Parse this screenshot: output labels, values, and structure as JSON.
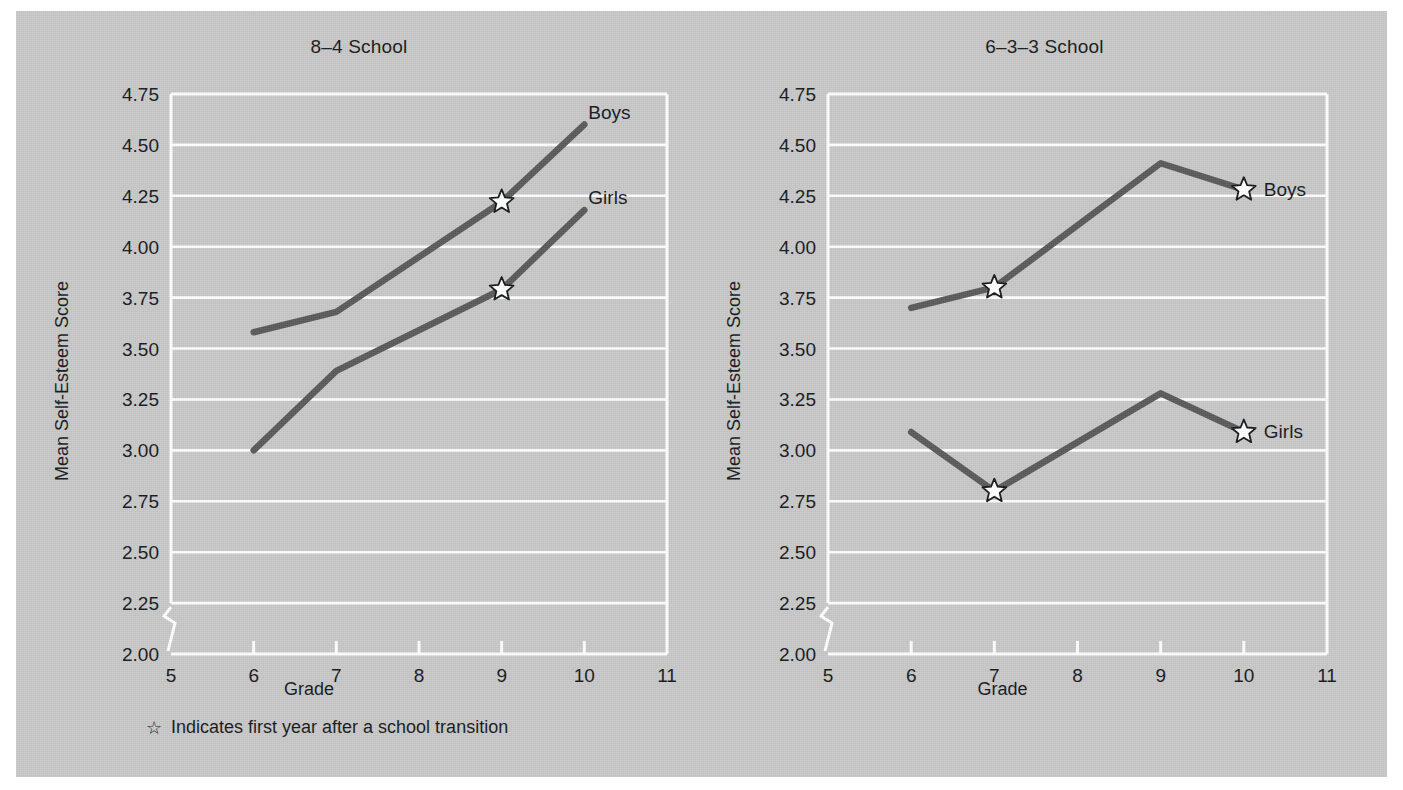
{
  "figure": {
    "background_color": "#c9c9c9",
    "page_color": "#ffffff",
    "line_color": "#5a5a5a",
    "grid_color": "#ffffff",
    "text_color": "#15181a",
    "star_glyph": "☆",
    "footnote": "Indicates first year after a school transition"
  },
  "chart_data": [
    {
      "type": "line",
      "title": "8–4 School",
      "xlabel": "Grade",
      "ylabel": "Mean Self-Esteem Score",
      "xlim": [
        5,
        11
      ],
      "ylim": [
        2.0,
        4.75
      ],
      "xticks": [
        "5",
        "6",
        "7",
        "8",
        "9",
        "10",
        "11"
      ],
      "yticks": [
        "2.00",
        "2.25",
        "2.50",
        "2.75",
        "3.00",
        "3.25",
        "3.50",
        "3.75",
        "4.00",
        "4.25",
        "4.50",
        "4.75"
      ],
      "grid": "horizontal",
      "axis_break": "y-axis break between 2.00 and 2.25",
      "legend_position": "inline at line ends",
      "series": [
        {
          "name": "Boys",
          "x": [
            6,
            7,
            9,
            10
          ],
          "values": [
            3.58,
            3.68,
            4.22,
            4.6
          ],
          "transition_markers": [
            9
          ]
        },
        {
          "name": "Girls",
          "x": [
            6,
            7,
            9,
            10
          ],
          "values": [
            3.0,
            3.39,
            3.79,
            4.18
          ],
          "transition_markers": [
            9
          ]
        }
      ]
    },
    {
      "type": "line",
      "title": "6–3–3 School",
      "xlabel": "Grade",
      "ylabel": "Mean Self-Esteem Score",
      "xlim": [
        5,
        11
      ],
      "ylim": [
        2.0,
        4.75
      ],
      "xticks": [
        "5",
        "6",
        "7",
        "8",
        "9",
        "10",
        "11"
      ],
      "yticks": [
        "2.00",
        "2.25",
        "2.50",
        "2.75",
        "3.00",
        "3.25",
        "3.50",
        "3.75",
        "4.00",
        "4.25",
        "4.50",
        "4.75"
      ],
      "grid": "horizontal",
      "axis_break": "y-axis break between 2.00 and 2.25",
      "legend_position": "inline at line ends",
      "series": [
        {
          "name": "Boys",
          "x": [
            6,
            7,
            9,
            10
          ],
          "values": [
            3.7,
            3.8,
            4.41,
            4.28
          ],
          "transition_markers": [
            7,
            10
          ]
        },
        {
          "name": "Girls",
          "x": [
            6,
            7,
            9,
            10
          ],
          "values": [
            3.09,
            2.8,
            3.28,
            3.09
          ],
          "transition_markers": [
            7,
            10
          ]
        }
      ]
    }
  ]
}
